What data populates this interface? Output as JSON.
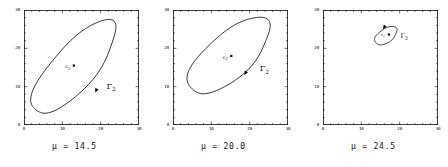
{
  "figure": {
    "panel_count": 3,
    "axis": {
      "xlim": [
        0,
        30
      ],
      "ylim": [
        0,
        30
      ],
      "xticks": [
        0,
        10,
        20,
        30
      ],
      "yticks": [
        0,
        10,
        20,
        30
      ],
      "xtick_labels": [
        "0",
        "10",
        "20",
        "30"
      ],
      "ytick_labels": [
        "0",
        "10",
        "20",
        "30"
      ],
      "minor_tick_step": 2,
      "frame": "box",
      "tick_direction": "in",
      "grid": false
    },
    "colors": {
      "ink": "#111111",
      "background": "#ffffff"
    },
    "panels": [
      {
        "id": "panel-0",
        "caption": "μ  =  14.5",
        "mu": 14.5,
        "equilibrium_label": "c",
        "equilibrium_sub": "2",
        "equilibrium_point": [
          13.0,
          15.5
        ],
        "cycle_label": "Γ",
        "cycle_sub": "2",
        "cycle": {
          "center": [
            13.0,
            15.0
          ],
          "semi_major": 15.4,
          "semi_minor": 5.6,
          "angle_deg": 49
        },
        "cycle_label_pos": [
          21.5,
          9.5
        ],
        "arrow_pos": [
          18.6,
          8.4
        ]
      },
      {
        "id": "panel-1",
        "caption": "μ  =  20.0",
        "mu": 20.0,
        "equilibrium_label": "c",
        "equilibrium_sub": "2",
        "equilibrium_point": [
          15.2,
          18.0
        ],
        "cycle_label": "Γ",
        "cycle_sub": "2",
        "cycle": {
          "center": [
            14.6,
            18.0
          ],
          "semi_major": 13.4,
          "semi_minor": 5.8,
          "angle_deg": 42
        },
        "cycle_label_pos": [
          22.6,
          14.0
        ],
        "arrow_pos": [
          18.6,
          13.0
        ]
      },
      {
        "id": "panel-2",
        "caption": "μ  =  24.5",
        "mu": 24.5,
        "equilibrium_label": "c",
        "equilibrium_sub": "2",
        "equilibrium_point": [
          17.2,
          23.6
        ],
        "cycle_label": "Γ",
        "cycle_sub": "2",
        "cycle": {
          "center": [
            16.4,
            23.3
          ],
          "semi_major": 3.3,
          "semi_minor": 1.8,
          "angle_deg": 35
        },
        "cycle_label_pos": [
          20.2,
          22.6
        ],
        "arrow_pos": [
          15.6,
          25.0
        ]
      }
    ]
  },
  "chart_data": {
    "type": "line",
    "title": "",
    "xlabel": "",
    "ylabel": "",
    "xlim": [
      0,
      30
    ],
    "ylim": [
      0,
      30
    ],
    "grid": false,
    "legend": "none",
    "series": [
      {
        "name": "Γ₂ at μ = 14.5",
        "kind": "closed-orbit",
        "center": [
          13.0,
          15.0
        ],
        "semi_major": 15.4,
        "semi_minor": 5.6,
        "angle_deg": 49,
        "equilibrium": [
          13.0,
          15.5
        ]
      },
      {
        "name": "Γ₂ at μ = 20.0",
        "kind": "closed-orbit",
        "center": [
          14.6,
          18.0
        ],
        "semi_major": 13.4,
        "semi_minor": 5.8,
        "angle_deg": 42,
        "equilibrium": [
          15.2,
          18.0
        ]
      },
      {
        "name": "Γ₂ at μ = 24.5",
        "kind": "closed-orbit",
        "center": [
          16.4,
          23.3
        ],
        "semi_major": 3.3,
        "semi_minor": 1.8,
        "angle_deg": 35,
        "equilibrium": [
          17.2,
          23.6
        ]
      }
    ],
    "categories": [
      "μ = 14.5",
      "μ = 20.0",
      "μ = 24.5"
    ],
    "values": [
      15.4,
      13.4,
      3.3
    ]
  }
}
